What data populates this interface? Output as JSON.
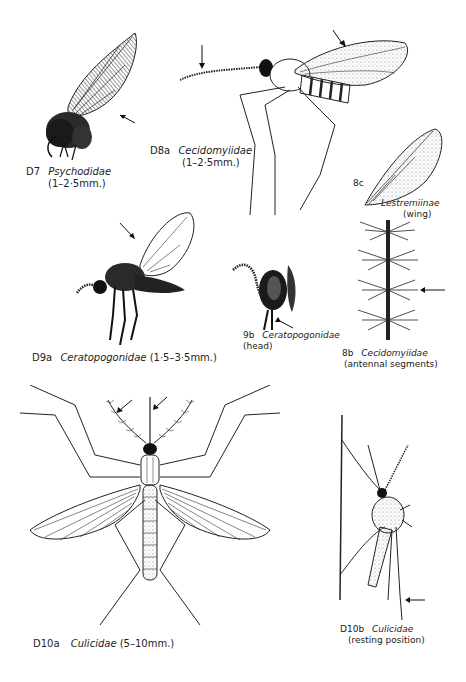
{
  "page": {
    "type": "illustration-plate",
    "background": "#ffffff",
    "ink_color": "#1a1a1a"
  },
  "figures": [
    {
      "id": "D7",
      "code": "D7",
      "taxon": "Psychodidae",
      "size": "(1–2·5mm.)",
      "subtitle": "",
      "icon": "moth-fly-icon"
    },
    {
      "id": "D8a",
      "code": "D8a",
      "taxon": "Cecidomyiidae",
      "size": "(1–2·5mm.)",
      "subtitle": "",
      "icon": "gall-midge-icon"
    },
    {
      "id": "8c",
      "code": "8c",
      "taxon": "Lestremiinae",
      "size": "",
      "subtitle": "(wing)",
      "icon": "wing-icon"
    },
    {
      "id": "D9a",
      "code": "D9a",
      "taxon": "Ceratopogonidae",
      "size": "(1·5–3·5mm.)",
      "subtitle": "",
      "icon": "biting-midge-icon"
    },
    {
      "id": "9b",
      "code": "9b",
      "taxon": "Ceratopogonidae",
      "size": "",
      "subtitle": "(head)",
      "icon": "midge-head-icon"
    },
    {
      "id": "8b",
      "code": "8b",
      "taxon": "Cecidomyiidae",
      "size": "",
      "subtitle": "(antennal segments)",
      "icon": "antenna-segments-icon"
    },
    {
      "id": "D10a",
      "code": "D10a",
      "taxon": "Culicidae",
      "size": "(5–10mm.)",
      "subtitle": "",
      "icon": "mosquito-dorsal-icon"
    },
    {
      "id": "D10b",
      "code": "D10b",
      "taxon": "Culicidae",
      "size": "",
      "subtitle": "(resting position)",
      "icon": "mosquito-resting-icon"
    }
  ]
}
